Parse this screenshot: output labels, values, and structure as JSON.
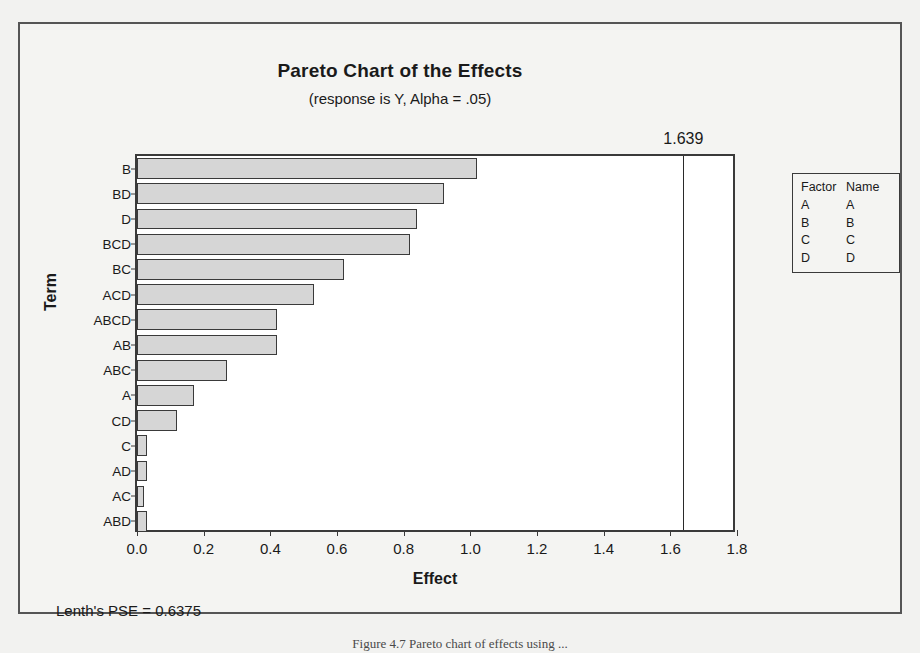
{
  "figure": {
    "caption": "Figure 4.7   Pareto chart of effects using ..."
  },
  "chart_data": {
    "type": "bar",
    "orientation": "horizontal",
    "title": "Pareto Chart of the Effects",
    "subtitle": "(response is Y, Alpha = .05)",
    "xlabel": "Effect",
    "ylabel": "Term",
    "categories": [
      "B",
      "BD",
      "D",
      "BCD",
      "BC",
      "ACD",
      "ABCD",
      "AB",
      "ABC",
      "A",
      "CD",
      "C",
      "AD",
      "AC",
      "ABD"
    ],
    "values": [
      1.02,
      0.92,
      0.84,
      0.82,
      0.62,
      0.53,
      0.42,
      0.42,
      0.27,
      0.17,
      0.12,
      0.03,
      0.03,
      0.02,
      0.03
    ],
    "xlim": [
      0.0,
      1.8
    ],
    "xticks": [
      "0.0",
      "0.2",
      "0.4",
      "0.6",
      "0.8",
      "1.0",
      "1.2",
      "1.4",
      "1.6",
      "1.8"
    ],
    "xtick_values": [
      0.0,
      0.2,
      0.4,
      0.6,
      0.8,
      1.0,
      1.2,
      1.4,
      1.6,
      1.8
    ],
    "grid": false,
    "reference_line": {
      "label": "1.639",
      "value": 1.639
    },
    "bar_color": "#d6d6d6",
    "bar_border_color": "#3a3a3a"
  },
  "legend": {
    "headers": [
      "Factor",
      "Name"
    ],
    "rows": [
      {
        "factor": "A",
        "name": "A"
      },
      {
        "factor": "B",
        "name": "B"
      },
      {
        "factor": "C",
        "name": "C"
      },
      {
        "factor": "D",
        "name": "D"
      }
    ]
  },
  "footnote": {
    "text": "Lenth's PSE = 0.6375"
  }
}
